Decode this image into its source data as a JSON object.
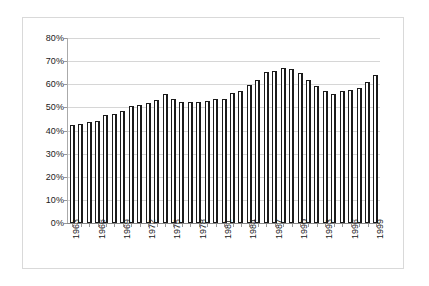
{
  "chart_data": {
    "type": "bar",
    "title": "",
    "subtitle": "",
    "xlabel": "",
    "ylabel": "",
    "legend": [],
    "legend_position": "none",
    "grid": true,
    "ylim": [
      0,
      80
    ],
    "ytick_labels": [
      "80%",
      "70%",
      "60%",
      "50%",
      "40%",
      "30%",
      "20%",
      "10%",
      "0%"
    ],
    "ytick_values": [
      80,
      70,
      60,
      50,
      40,
      30,
      20,
      10,
      0
    ],
    "xtick_label_interval": 3,
    "categories": [
      "1963",
      "1964",
      "1965",
      "1966",
      "1967",
      "1968",
      "1969",
      "1970",
      "1971",
      "1972",
      "1973",
      "1974",
      "1975",
      "1976",
      "1977",
      "1978",
      "1979",
      "1980",
      "1981",
      "1982",
      "1983",
      "1984",
      "1985",
      "1986",
      "1987",
      "1988",
      "1989",
      "1990",
      "1991",
      "1992",
      "1993",
      "1994",
      "1995",
      "1996",
      "1997",
      "1998",
      "1999"
    ],
    "values": [
      42.5,
      43.0,
      43.5,
      44.3,
      46.6,
      47.1,
      48.5,
      50.6,
      51.2,
      52.1,
      53.1,
      55.7,
      53.8,
      52.2,
      52.3,
      52.2,
      52.9,
      53.5,
      53.8,
      56.3,
      57.3,
      59.6,
      62.0,
      65.3,
      65.9,
      67.1,
      66.8,
      65.0,
      62.0,
      59.2,
      57.1,
      55.8,
      57.0,
      57.4,
      58.2,
      61.0,
      64.1
    ],
    "colors": {
      "bar_fill": "#ffffff",
      "bar_border": "#1b1b1b",
      "gridline": "#d6d6d6",
      "axis": "#999999",
      "frame": "#d9d9d9",
      "text": "#1a1a1a",
      "background": "#ffffff"
    }
  }
}
